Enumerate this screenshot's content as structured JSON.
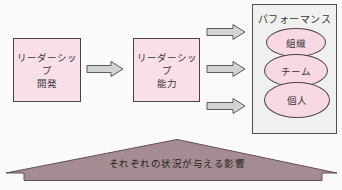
{
  "figure": {
    "boxes": {
      "development": {
        "line1": "リーダーシップ",
        "line2": "開発"
      },
      "ability": {
        "line1": "リーダーシップ",
        "line2": "能力"
      }
    },
    "performance": {
      "title": "パフォーマンス",
      "levels": [
        {
          "label": "組織"
        },
        {
          "label": "チーム"
        },
        {
          "label": "個人"
        }
      ]
    },
    "banner": {
      "label": "それぞれの状況が与える影響"
    },
    "colors": {
      "box_fill": "#f8dfe8",
      "box_border": "#4b4347",
      "arrow_fill": "#d2d4d2",
      "arrow_border": "#5a5a5a",
      "panel_fill": "#f0f1ef",
      "panel_border": "#55504f",
      "ellipse_fill": "#f8d9e3",
      "banner_fill": "#a58c92",
      "banner_border": "#5f5054",
      "background": "#fafaf9"
    }
  }
}
